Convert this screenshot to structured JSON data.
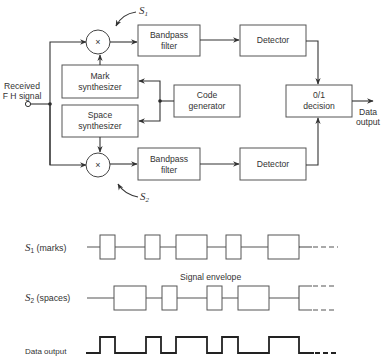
{
  "block_diagram": {
    "input_label_line1": "Received",
    "input_label_line2": "F H signal",
    "mixer_symbol": "×",
    "s1_label": "S",
    "s1_sub": "1",
    "s2_label": "S",
    "s2_sub": "2",
    "blocks": {
      "bandpass_top": [
        "Bandpass",
        "filter"
      ],
      "detector_top": [
        "Detector"
      ],
      "mark_synth": [
        "Mark",
        "synthesizer"
      ],
      "space_synth": [
        "Space",
        "synthesizer"
      ],
      "code_gen": [
        "Code",
        "generator"
      ],
      "decision": [
        "0/1",
        "decision"
      ],
      "bandpass_bottom": [
        "Bandpass",
        "filter"
      ],
      "detector_bottom": [
        "Detector"
      ]
    },
    "output_label_line1": "Data",
    "output_label_line2": "output"
  },
  "waveforms": {
    "s1_label_sym": "S",
    "s1_label_sub": "1",
    "s1_label_text": " (marks)",
    "s2_label_sym": "S",
    "s2_label_sub": "2",
    "s2_label_text": " (spaces)",
    "envelope_label": "Signal envelope",
    "data_label": "Data output",
    "s1_boxes": [
      [
        100,
        115
      ],
      [
        145,
        160
      ],
      [
        176,
        207
      ],
      [
        226,
        241
      ],
      [
        268,
        299
      ]
    ],
    "s2_boxes": [
      [
        114,
        146
      ],
      [
        162,
        177
      ],
      [
        207,
        222
      ],
      [
        238,
        269
      ]
    ],
    "data_high_segments": [
      [
        100,
        115
      ],
      [
        146,
        161
      ],
      [
        176,
        207
      ],
      [
        222,
        238
      ],
      [
        269,
        299
      ]
    ]
  }
}
